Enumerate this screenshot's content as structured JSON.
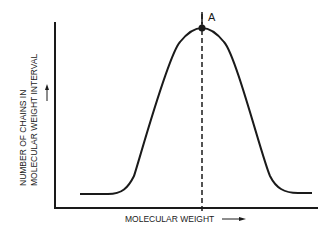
{
  "diagram": {
    "type": "distribution-curve",
    "y_axis_label_line1": "NUMBER OF CHAINS IN",
    "y_axis_label_line2": "MOLECULAR WEIGHT INTERVAL",
    "x_axis_label": "MOLECULAR WEIGHT",
    "peak_label": "A",
    "colors": {
      "ink": "#1a1a1a",
      "background": "#ffffff"
    }
  }
}
